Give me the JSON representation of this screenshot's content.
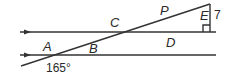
{
  "diagram": {
    "type": "geometry",
    "labels": {
      "A": "A",
      "B": "B",
      "C": "C",
      "D": "D",
      "E": "E",
      "P": "P"
    },
    "angle_label": "165°",
    "side_length": "7",
    "right_angle_marker": true,
    "parallel_markers": "arrows"
  }
}
